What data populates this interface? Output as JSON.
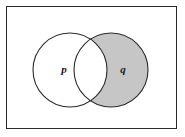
{
  "diagram": {
    "type": "venn-diagram",
    "universe": {
      "name": "universal-set",
      "shape": "rectangle",
      "fill": "#ffffff",
      "stroke": "#2b2b2b",
      "stroke_width": 1,
      "x": 6,
      "y": 6,
      "width": 171,
      "height": 123
    },
    "colors": {
      "shade": "#c6c6c6",
      "outline": "#2b2b2b",
      "background": "#ffffff",
      "label": "#1a1a1a"
    },
    "circles": [
      {
        "id": "circle-p",
        "label": "p",
        "cx": 70,
        "cy": 70,
        "r": 37,
        "shaded": false,
        "label_x": 64,
        "label_y": 70
      },
      {
        "id": "circle-q",
        "label": "q",
        "cx": 111,
        "cy": 70,
        "r": 37,
        "shaded": true,
        "label_x": 123,
        "label_y": 70
      }
    ],
    "regions": {
      "p_only": {
        "name": "p-only-region",
        "shaded": false
      },
      "intersection": {
        "name": "p-and-q-region",
        "shaded": false
      },
      "q_only": {
        "name": "q-only-region",
        "shaded": true
      },
      "outside": {
        "name": "outside-both-region",
        "shaded": false
      }
    },
    "shaded_set_expression": "q and not p"
  },
  "labels": {
    "p": "p",
    "q": "q"
  }
}
